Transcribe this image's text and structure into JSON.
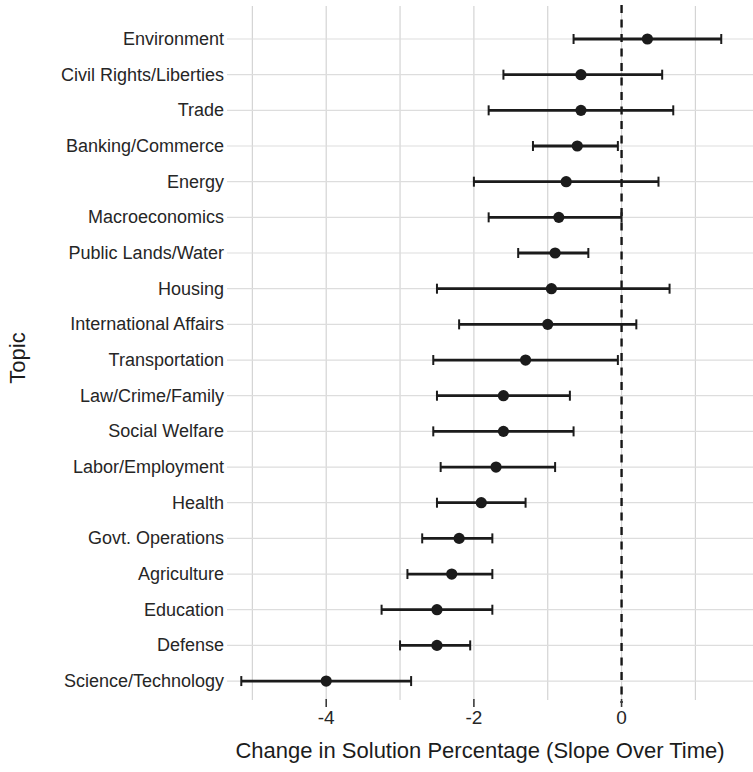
{
  "figure": {
    "background": "#ffffff"
  },
  "chart_data": {
    "type": "scatter",
    "subtype": "dot-whisker-coefficient-plot",
    "orientation": "horizontal",
    "title": "",
    "xlabel": "Change in Solution Percentage (Slope Over Time)",
    "ylabel": "Topic",
    "xlim": [
      -5.33,
      1.78
    ],
    "xticks": [
      {
        "value": -4,
        "label": "-4"
      },
      {
        "value": -2,
        "label": "-2"
      },
      {
        "value": 0,
        "label": "0"
      }
    ],
    "grid": {
      "vertical_lines_at": [
        -5,
        -4,
        -3,
        -2,
        -1,
        0,
        1
      ],
      "horizontal_line_per_row": true
    },
    "zero_line": {
      "x": 0,
      "style": "dashed"
    },
    "legend": "none",
    "points": [
      {
        "topic": "Environment",
        "estimate": 0.35,
        "ci_low": -0.65,
        "ci_high": 1.35
      },
      {
        "topic": "Civil Rights/Liberties",
        "estimate": -0.55,
        "ci_low": -1.6,
        "ci_high": 0.55
      },
      {
        "topic": "Trade",
        "estimate": -0.55,
        "ci_low": -1.8,
        "ci_high": 0.7
      },
      {
        "topic": "Banking/Commerce",
        "estimate": -0.6,
        "ci_low": -1.2,
        "ci_high": -0.05
      },
      {
        "topic": "Energy",
        "estimate": -0.75,
        "ci_low": -2.0,
        "ci_high": 0.5
      },
      {
        "topic": "Macroeconomics",
        "estimate": -0.85,
        "ci_low": -1.8,
        "ci_high": 0.0
      },
      {
        "topic": "Public Lands/Water",
        "estimate": -0.9,
        "ci_low": -1.4,
        "ci_high": -0.45
      },
      {
        "topic": "Housing",
        "estimate": -0.95,
        "ci_low": -2.5,
        "ci_high": 0.65
      },
      {
        "topic": "International Affairs",
        "estimate": -1.0,
        "ci_low": -2.2,
        "ci_high": 0.2
      },
      {
        "topic": "Transportation",
        "estimate": -1.3,
        "ci_low": -2.55,
        "ci_high": -0.05
      },
      {
        "topic": "Law/Crime/Family",
        "estimate": -1.6,
        "ci_low": -2.5,
        "ci_high": -0.7
      },
      {
        "topic": "Social Welfare",
        "estimate": -1.6,
        "ci_low": -2.55,
        "ci_high": -0.65
      },
      {
        "topic": "Labor/Employment",
        "estimate": -1.7,
        "ci_low": -2.45,
        "ci_high": -0.9
      },
      {
        "topic": "Health",
        "estimate": -1.9,
        "ci_low": -2.5,
        "ci_high": -1.3
      },
      {
        "topic": "Govt. Operations",
        "estimate": -2.2,
        "ci_low": -2.7,
        "ci_high": -1.75
      },
      {
        "topic": "Agriculture",
        "estimate": -2.3,
        "ci_low": -2.9,
        "ci_high": -1.75
      },
      {
        "topic": "Education",
        "estimate": -2.5,
        "ci_low": -3.25,
        "ci_high": -1.75
      },
      {
        "topic": "Defense",
        "estimate": -2.5,
        "ci_low": -3.0,
        "ci_high": -2.05
      },
      {
        "topic": "Science/Technology",
        "estimate": -4.0,
        "ci_low": -5.15,
        "ci_high": -2.85
      }
    ],
    "colors": {
      "marker": "#1b1b1b",
      "whisker": "#1b1b1b",
      "zero_line": "#161616",
      "grid": "#d4d4d4",
      "row_grid": "#dddddd",
      "text": "#262626",
      "tick": "#3a3a3a",
      "background": "#ffffff"
    }
  }
}
